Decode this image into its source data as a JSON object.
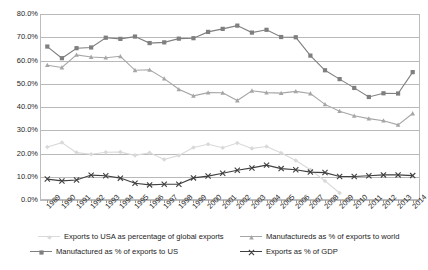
{
  "chart_data": {
    "type": "line",
    "title": "",
    "xlabel": "",
    "ylabel": "",
    "ylim": [
      0,
      80
    ],
    "ytick_labels": [
      "0.0%",
      "10.0%",
      "20.0%",
      "30.0%",
      "40.0%",
      "50.0%",
      "60.0%",
      "70.0%",
      "80.0%"
    ],
    "ytick_values": [
      0,
      10,
      20,
      30,
      40,
      50,
      60,
      70,
      80
    ],
    "grid": true,
    "legend_position": "bottom",
    "categories": [
      "1989",
      "1990",
      "1991",
      "1992",
      "1993",
      "1994",
      "1995",
      "1996",
      "1997",
      "1998",
      "1999",
      "2000",
      "2001",
      "2002",
      "2003",
      "2004",
      "2005",
      "2006",
      "2007",
      "2008",
      "2009",
      "2010",
      "2011",
      "2012",
      "2013",
      "2014"
    ],
    "series": [
      {
        "name": "Manufactured as % of exports to US",
        "color": "#7f7f7f",
        "marker": "square",
        "values": [
          66.0,
          61.0,
          65.3,
          65.6,
          69.8,
          69.3,
          70.3,
          67.5,
          67.8,
          69.4,
          69.6,
          72.3,
          73.6,
          75.0,
          72.0,
          73.2,
          70.1,
          70.0,
          62.1,
          55.8,
          52.0,
          48.2,
          44.3,
          45.9,
          45.8,
          55.0
        ]
      },
      {
        "name": "Manufactureds as % of exports to world",
        "color": "#a6a6a6",
        "marker": "triangle",
        "values": [
          58.0,
          57.0,
          62.4,
          61.5,
          61.2,
          61.8,
          55.8,
          56.0,
          52.2,
          47.6,
          44.8,
          46.2,
          46.1,
          42.8,
          47.0,
          46.2,
          46.0,
          46.7,
          45.8,
          41.1,
          38.2,
          36.2,
          35.0,
          34.1,
          32.3,
          37.2
        ]
      },
      {
        "name": "Exports to USA as percentage of global exports",
        "color": "#d9d9d9",
        "marker": "diamond",
        "values": [
          22.8,
          24.7,
          20.4,
          19.7,
          20.5,
          20.6,
          19.2,
          20.3,
          17.4,
          19.2,
          22.6,
          24.0,
          22.5,
          24.5,
          22.2,
          23.0,
          20.2,
          17.0,
          13.0,
          8.2,
          3.0,
          null,
          null,
          null,
          null,
          null
        ]
      },
      {
        "name": "Exports as % of GDP",
        "color": "#404040",
        "marker": "cross",
        "values": [
          9.0,
          8.2,
          8.6,
          10.7,
          10.4,
          9.4,
          7.2,
          6.5,
          6.8,
          6.8,
          9.5,
          10.3,
          11.5,
          12.8,
          13.8,
          15.0,
          13.5,
          13.0,
          12.0,
          11.8,
          10.1,
          10.1,
          10.4,
          10.8,
          10.8,
          10.5
        ]
      }
    ]
  },
  "legend": {
    "items": [
      {
        "label": "Exports to USA as percentage of global exports",
        "series_index": 2
      },
      {
        "label": "Manufactureds as % of exports to world",
        "series_index": 1
      },
      {
        "label": "Manufactured as % of exports to US",
        "series_index": 0
      },
      {
        "label": "Exports as % of GDP",
        "series_index": 3
      }
    ]
  }
}
